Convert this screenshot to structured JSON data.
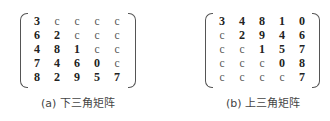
{
  "figures": [
    {
      "caption": "(a) 下三角矩阵",
      "matrix": [
        [
          "3",
          "c",
          "c",
          "c",
          "c"
        ],
        [
          "6",
          "2",
          "c",
          "c",
          "c"
        ],
        [
          "4",
          "8",
          "1",
          "c",
          "c"
        ],
        [
          "7",
          "4",
          "6",
          "0",
          "c"
        ],
        [
          "8",
          "2",
          "9",
          "5",
          "7"
        ]
      ]
    },
    {
      "caption": "(b) 上三角矩阵",
      "matrix": [
        [
          "3",
          "4",
          "8",
          "1",
          "0"
        ],
        [
          "c",
          "2",
          "9",
          "4",
          "6"
        ],
        [
          "c",
          "c",
          "1",
          "5",
          "7"
        ],
        [
          "c",
          "c",
          "c",
          "0",
          "8"
        ],
        [
          "c",
          "c",
          "c",
          "c",
          "7"
        ]
      ]
    }
  ]
}
